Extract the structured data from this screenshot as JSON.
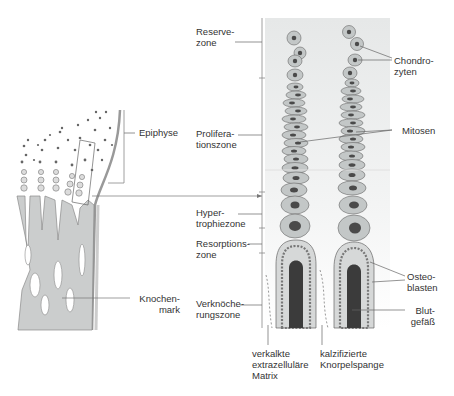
{
  "diagram": {
    "left_panel": {
      "labels": {
        "epiphyse": "Epiphyse",
        "knochenmark": "Knochen-\nmark"
      }
    },
    "zones": {
      "reserve": "Reserve-\nzone",
      "proliferation": "Prolifera-\ntionszone",
      "hypertrophie": "Hyper-\ntrophiezone",
      "resorption": "Resorptions-\nzone",
      "verknoecherung": "Verknöche-\nrungszone"
    },
    "right_labels": {
      "chondrozyten": "Chondro-\nzyten",
      "mitosen": "Mitosen",
      "osteoblasten": "Osteo-\nblasten",
      "blutgefaess": "Blut-\ngefäß"
    },
    "bottom_labels": {
      "matrix": "verkalkte\nextrazelluläre\nMatrix",
      "knorpelspange": "kalzifizierte\nKnorpelspange"
    },
    "colors": {
      "bone": "#c9cbcb",
      "cartilage_bg": "#eceeee",
      "cell_fill": "#c2c6c6",
      "nucleus": "#4a4a4a",
      "vessel": "#3b3b3b",
      "line": "#777777"
    }
  }
}
